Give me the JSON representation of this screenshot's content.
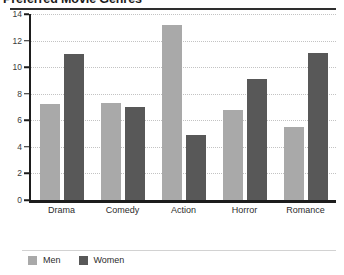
{
  "chart_data": {
    "type": "bar",
    "title": "Preferred Movie Genres",
    "categories": [
      "Drama",
      "Comedy",
      "Action",
      "Horror",
      "Romance"
    ],
    "series": [
      {
        "name": "Men",
        "color": "#a9a9a9",
        "values": [
          7.2,
          7.3,
          13.2,
          6.8,
          5.5
        ]
      },
      {
        "name": "Women",
        "color": "#585858",
        "values": [
          11.0,
          7.0,
          4.9,
          9.1,
          11.1
        ]
      }
    ],
    "xlabel": "",
    "ylabel": "",
    "ylim": [
      0,
      14
    ],
    "yticks": [
      0,
      2,
      4,
      6,
      8,
      10,
      12,
      14
    ],
    "grid": true,
    "grid_style": "dotted-horizontal",
    "legend_position": "bottom-left"
  }
}
